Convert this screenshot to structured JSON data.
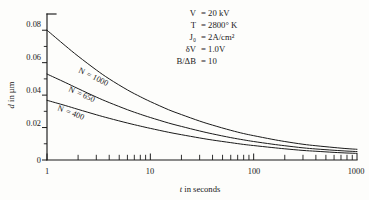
{
  "chart_data": {
    "type": "line",
    "title": "",
    "subtitle": "",
    "xlabel": "t in seconds",
    "ylabel": "d in µm",
    "xscale": "log",
    "yscale": "linear",
    "xlim": [
      1,
      1000
    ],
    "ylim": [
      0,
      0.09
    ],
    "grid": false,
    "legend_position": "inline-curve-labels",
    "xticks": [
      1,
      10,
      100,
      1000
    ],
    "xtick_labels": [
      "1",
      "10",
      "100",
      "1000"
    ],
    "yticks": [
      0,
      0.02,
      0.04,
      0.06,
      0.08
    ],
    "ytick_labels": [
      "0",
      "0.02",
      "0.04",
      "0.06",
      "0.08"
    ],
    "yminor_ticks": [
      0.01,
      0.03,
      0.05,
      0.07
    ],
    "series": [
      {
        "name": "N = 1000",
        "label": "N = 1000",
        "x": [
          1,
          1.5,
          2,
          3,
          4,
          6,
          8,
          10,
          15,
          20,
          30,
          40,
          60,
          80,
          100,
          150,
          200,
          300,
          400,
          600,
          800,
          1000
        ],
        "values": [
          0.08,
          0.0705,
          0.064,
          0.0555,
          0.05,
          0.0432,
          0.039,
          0.036,
          0.031,
          0.028,
          0.024,
          0.0215,
          0.0183,
          0.0163,
          0.015,
          0.0128,
          0.0114,
          0.0097,
          0.0088,
          0.0077,
          0.007,
          0.0066
        ]
      },
      {
        "name": "N = 650",
        "label": "N = 650",
        "x": [
          1,
          1.5,
          2,
          3,
          4,
          6,
          8,
          10,
          15,
          20,
          30,
          40,
          60,
          80,
          100,
          150,
          200,
          300,
          400,
          600,
          800,
          1000
        ],
        "values": [
          0.053,
          0.0478,
          0.044,
          0.0388,
          0.0354,
          0.031,
          0.0282,
          0.0262,
          0.0228,
          0.0207,
          0.0179,
          0.0161,
          0.0138,
          0.0124,
          0.0114,
          0.0098,
          0.0088,
          0.0075,
          0.0068,
          0.006,
          0.0055,
          0.0052
        ]
      },
      {
        "name": "N = 400",
        "label": "N = 400",
        "x": [
          1,
          1.5,
          2,
          3,
          4,
          6,
          8,
          10,
          15,
          20,
          30,
          40,
          60,
          80,
          100,
          150,
          200,
          300,
          400,
          600,
          800,
          1000
        ],
        "values": [
          0.0368,
          0.0336,
          0.0312,
          0.0279,
          0.0257,
          0.0228,
          0.0209,
          0.0195,
          0.0171,
          0.0156,
          0.0136,
          0.0123,
          0.0107,
          0.0096,
          0.0089,
          0.0077,
          0.0069,
          0.0059,
          0.0054,
          0.0047,
          0.0043,
          0.0041
        ]
      }
    ],
    "annotations": [
      "V = 20 kV",
      "T = 2800° K",
      "J₀ = 2A/cm²",
      "δV = 1.0V",
      "B/ΔB = 10"
    ]
  },
  "axes": {
    "ylabel_italic": "d",
    "ylabel_rest": " in µm",
    "xlabel_italic": "t",
    "xlabel_rest": " in seconds"
  },
  "annotations": {
    "line1_sym": "V",
    "line1_val": "= 20 kV",
    "line2_sym": "T",
    "line2_val": "= 2800° K",
    "line3_sym": "J₀",
    "line3_val": "= 2A/cm²",
    "line4_sym": "δV",
    "line4_val": "= 1.0V",
    "line5_sym": "B/ΔB",
    "line5_val": "= 10"
  },
  "curve_labels": {
    "c1_sym": "N",
    "c1_val": "= 1000",
    "c2_sym": "N",
    "c2_val": "= 650",
    "c3_sym": "N",
    "c3_val": "= 400"
  },
  "ytick_labels": {
    "t0": "0",
    "t1": "0.02",
    "t2": "0.04",
    "t3": "0.06",
    "t4": "0.08"
  },
  "xtick_labels": {
    "t0": "1",
    "t1": "10",
    "t2": "100",
    "t3": "1000"
  },
  "colors": {
    "ink": "#1a1a1a",
    "paper": "#fdfdfb"
  }
}
